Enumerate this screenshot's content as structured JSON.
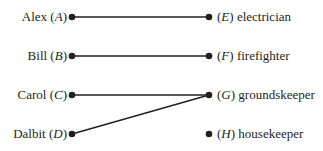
{
  "diagram": {
    "type": "bipartite-matching",
    "left_nodes": [
      {
        "id": "A",
        "name": "Alex",
        "letter": "A"
      },
      {
        "id": "B",
        "name": "Bill",
        "letter": "B"
      },
      {
        "id": "C",
        "name": "Carol",
        "letter": "C"
      },
      {
        "id": "D",
        "name": "Dalbit",
        "letter": "D"
      }
    ],
    "right_nodes": [
      {
        "id": "E",
        "letter": "E",
        "name": "electrician"
      },
      {
        "id": "F",
        "letter": "F",
        "name": "firefighter"
      },
      {
        "id": "G",
        "letter": "G",
        "name": "groundskeeper"
      },
      {
        "id": "H",
        "letter": "H",
        "name": "housekeeper"
      }
    ],
    "edges": [
      {
        "from": "A",
        "to": "E"
      },
      {
        "from": "B",
        "to": "F"
      },
      {
        "from": "C",
        "to": "G"
      },
      {
        "from": "D",
        "to": "G"
      }
    ]
  }
}
